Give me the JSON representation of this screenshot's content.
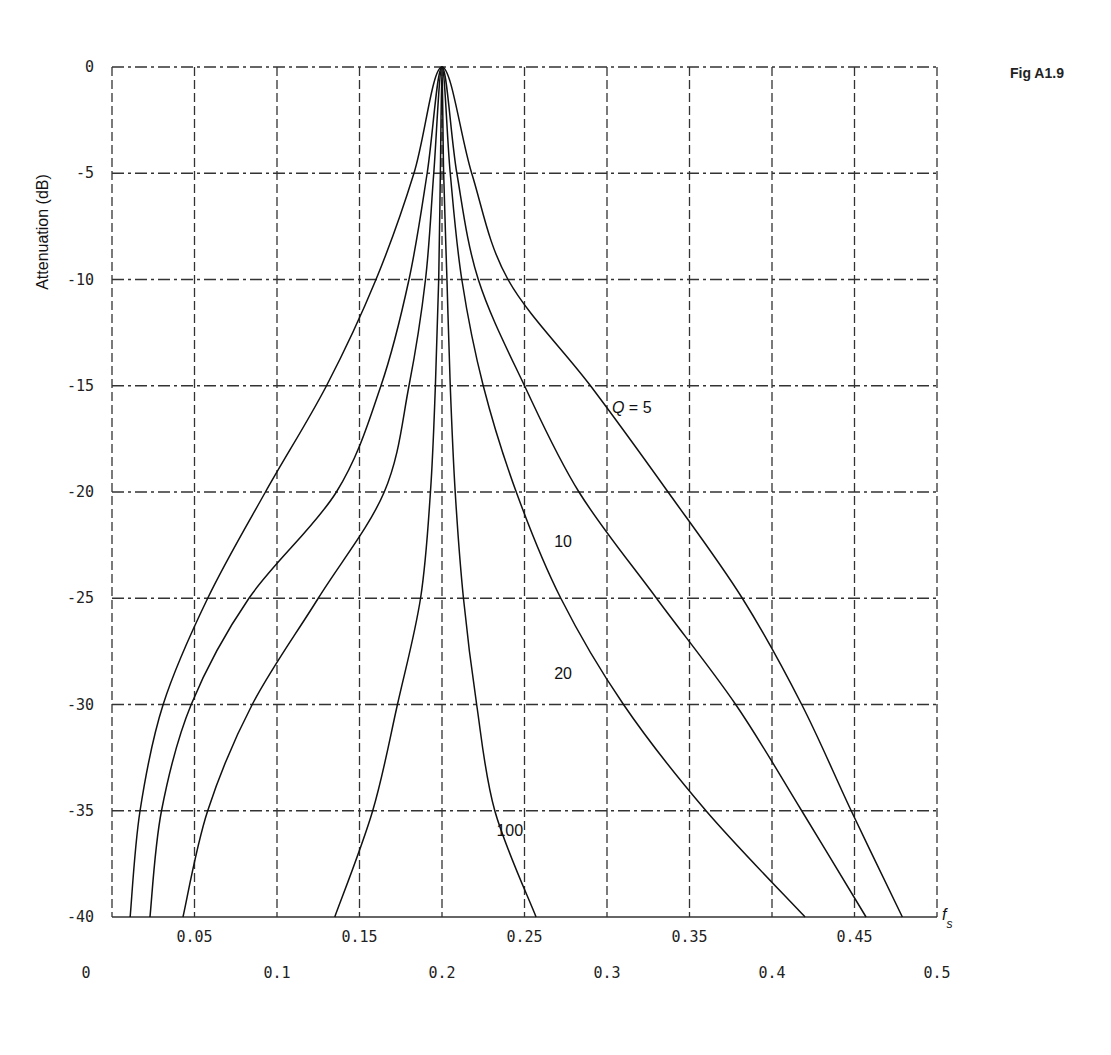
{
  "figure_label": "Fig A1.9",
  "chart_data": {
    "type": "line",
    "title": "",
    "xlabel": "f_s",
    "ylabel": "Attenuation (dB)",
    "xlim": [
      0,
      0.5
    ],
    "ylim": [
      -40,
      0
    ],
    "grid": true,
    "x_ticks_upper": [
      "0.05",
      "0.15",
      "0.25",
      "0.35",
      "0.45"
    ],
    "x_ticks_lower": [
      "0",
      "0.1",
      "0.2",
      "0.3",
      "0.4",
      "0.5"
    ],
    "y_ticks": [
      "0",
      "-5",
      "-10",
      "-15",
      "-20",
      "-25",
      "-30",
      "-35",
      "-40"
    ],
    "center_frequency": 0.2,
    "series": [
      {
        "name": "Q = 5",
        "label": "Q = 5",
        "points": [
          [
            0.011,
            -40
          ],
          [
            0.017,
            -35
          ],
          [
            0.031,
            -30
          ],
          [
            0.058,
            -25
          ],
          [
            0.093,
            -20
          ],
          [
            0.13,
            -15
          ],
          [
            0.16,
            -10
          ],
          [
            0.183,
            -5
          ],
          [
            0.2,
            0
          ],
          [
            0.218,
            -5
          ],
          [
            0.24,
            -10
          ],
          [
            0.29,
            -15
          ],
          [
            0.337,
            -20
          ],
          [
            0.382,
            -25
          ],
          [
            0.418,
            -30
          ],
          [
            0.448,
            -35
          ],
          [
            0.479,
            -40
          ]
        ]
      },
      {
        "name": "Q = 10",
        "label": "10",
        "points": [
          [
            0.023,
            -40
          ],
          [
            0.03,
            -35
          ],
          [
            0.048,
            -30
          ],
          [
            0.083,
            -25
          ],
          [
            0.136,
            -20
          ],
          [
            0.163,
            -15
          ],
          [
            0.18,
            -10
          ],
          [
            0.191,
            -5
          ],
          [
            0.2,
            0
          ],
          [
            0.209,
            -5
          ],
          [
            0.222,
            -10
          ],
          [
            0.25,
            -15
          ],
          [
            0.283,
            -20
          ],
          [
            0.33,
            -25
          ],
          [
            0.378,
            -30
          ],
          [
            0.418,
            -35
          ],
          [
            0.457,
            -40
          ]
        ]
      },
      {
        "name": "Q = 20",
        "label": "20",
        "points": [
          [
            0.043,
            -40
          ],
          [
            0.058,
            -35
          ],
          [
            0.085,
            -30
          ],
          [
            0.125,
            -25
          ],
          [
            0.165,
            -20
          ],
          [
            0.18,
            -15
          ],
          [
            0.19,
            -10
          ],
          [
            0.195,
            -5
          ],
          [
            0.2,
            0
          ],
          [
            0.205,
            -5
          ],
          [
            0.212,
            -10
          ],
          [
            0.225,
            -15
          ],
          [
            0.245,
            -20
          ],
          [
            0.272,
            -25
          ],
          [
            0.31,
            -30
          ],
          [
            0.36,
            -35
          ],
          [
            0.42,
            -40
          ]
        ]
      },
      {
        "name": "Q = 100",
        "label": "100",
        "points": [
          [
            0.135,
            -40
          ],
          [
            0.158,
            -35
          ],
          [
            0.173,
            -30
          ],
          [
            0.187,
            -25
          ],
          [
            0.193,
            -20
          ],
          [
            0.196,
            -15
          ],
          [
            0.198,
            -10
          ],
          [
            0.199,
            -5
          ],
          [
            0.2,
            0
          ],
          [
            0.201,
            -5
          ],
          [
            0.203,
            -10
          ],
          [
            0.205,
            -15
          ],
          [
            0.208,
            -20
          ],
          [
            0.213,
            -25
          ],
          [
            0.221,
            -30
          ],
          [
            0.232,
            -35
          ],
          [
            0.257,
            -40
          ]
        ]
      }
    ],
    "annotations": [
      {
        "text": "Q = 5",
        "x": 0.303,
        "y": -16.3
      },
      {
        "text": "10",
        "x": 0.268,
        "y": -22.6
      },
      {
        "text": "20",
        "x": 0.268,
        "y": -28.8
      },
      {
        "text": "100",
        "x": 0.233,
        "y": -36.2
      }
    ]
  }
}
